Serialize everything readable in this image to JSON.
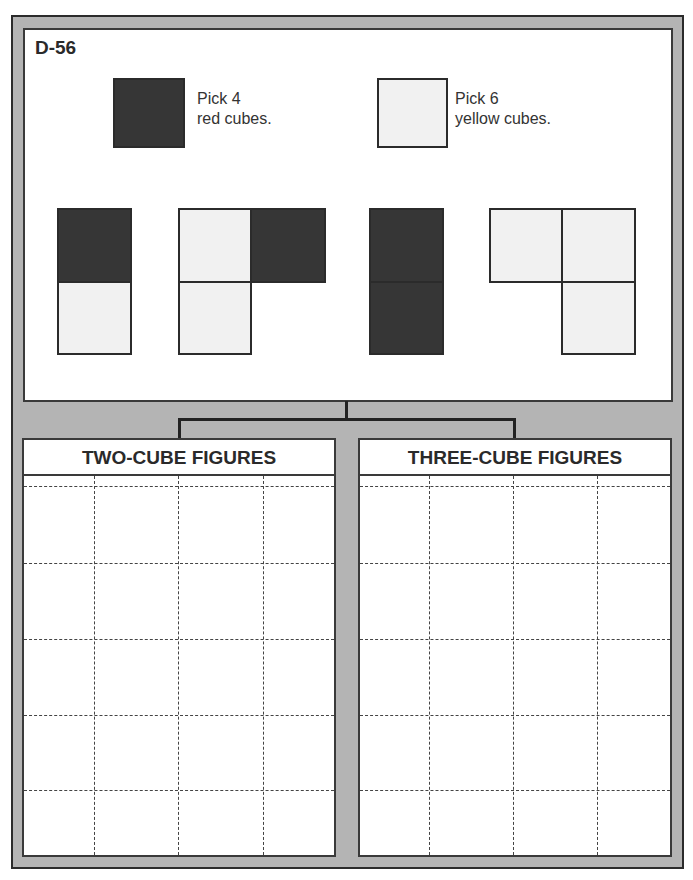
{
  "card": {
    "id": "D-56",
    "legend": [
      {
        "color": "red",
        "swatch_hex": "#363636",
        "line1": "Pick 4",
        "line2": "red cubes."
      },
      {
        "color": "yellow",
        "swatch_hex": "#f1f1f1",
        "line1": "Pick 6",
        "line2": "yellow cubes."
      }
    ],
    "example_figures": [
      {
        "name": "two-cube-vertical",
        "cubes": [
          "red (top)",
          "yellow (bottom)"
        ]
      },
      {
        "name": "three-cube-L",
        "cubes": [
          "yellow (top-left)",
          "red (top-right)",
          "yellow (bottom-left)"
        ]
      },
      {
        "name": "two-cube-vertical",
        "cubes": [
          "red (top)",
          "red (bottom)"
        ]
      },
      {
        "name": "three-cube-L",
        "cubes": [
          "yellow (top-left)",
          "yellow (top-right)",
          "yellow (bottom-right)"
        ]
      }
    ]
  },
  "sections": [
    {
      "title": "TWO-CUBE FIGURES",
      "grid_columns": 4,
      "grid_rows": 5
    },
    {
      "title": "THREE-CUBE FIGURES",
      "grid_columns": 4,
      "grid_rows": 5
    }
  ],
  "colors": {
    "frame_gray": "#b4b4b4",
    "border_dark": "#2b2b2b",
    "red_cube": "#363636",
    "yellow_cube": "#f1f1f1"
  }
}
